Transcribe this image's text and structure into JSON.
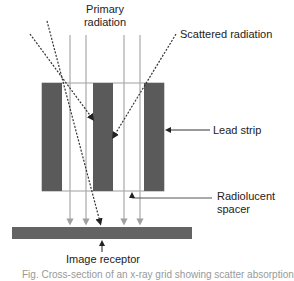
{
  "labels": {
    "primary_radiation_line1": "Primary",
    "primary_radiation_line2": "radiation",
    "scattered_radiation": "Scattered radiation",
    "lead_strip": "Lead strip",
    "radiolucent_spacer_line1": "Radiolucent",
    "radiolucent_spacer_line2": "spacer",
    "image_receptor": "Image receptor",
    "caption_truncated": "Fig. Cross-section of an x-ray grid showing scatter absorption"
  },
  "colors": {
    "lead_strip": "#5a5a5a",
    "receptor": "#636363",
    "primary_ray": "#a8a8a8",
    "scatter_ray": "#333333",
    "text": "#222222"
  }
}
